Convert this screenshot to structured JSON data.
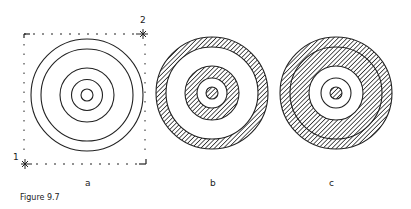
{
  "caption": "Figure 9.7",
  "colors": {
    "ink": "#222222",
    "background": "#ffffff"
  },
  "panels": [
    {
      "label": "a",
      "description": "Five concentric outline circles inside a dashed square frame",
      "frame": {
        "corner_markers": [
          {
            "label": "1",
            "position": "bottom-left"
          },
          {
            "label": "2",
            "position": "top-right"
          }
        ]
      },
      "rings_radii": [
        56,
        46,
        27,
        15,
        6
      ],
      "fill": "none"
    },
    {
      "label": "b",
      "description": "Alternating hatched and white concentric rings",
      "bands": [
        {
          "outer": 56,
          "inner": 46,
          "fill": "hatched"
        },
        {
          "outer": 46,
          "inner": 27,
          "fill": "white"
        },
        {
          "outer": 27,
          "inner": 15,
          "fill": "hatched"
        },
        {
          "outer": 15,
          "inner": 6,
          "fill": "white"
        },
        {
          "outer": 6,
          "inner": 0,
          "fill": "hatched"
        }
      ]
    },
    {
      "label": "c",
      "description": "Wide hatched outer band with interior line, white center with line circle and hatched core",
      "bands": [
        {
          "outer": 56,
          "inner": 27,
          "fill": "hatched",
          "line_at": 46
        },
        {
          "outer": 27,
          "inner": 6,
          "fill": "white",
          "line_at": 15
        },
        {
          "outer": 6,
          "inner": 0,
          "fill": "hatched"
        }
      ]
    }
  ],
  "markers": {
    "one": "1",
    "two": "2"
  }
}
